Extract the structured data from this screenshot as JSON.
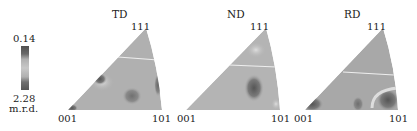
{
  "figure": {
    "colorbar": {
      "max_label": "0.14",
      "min_label": "2.28",
      "unit_label": "m.r.d.",
      "colors": [
        "#555555",
        "#777777",
        "#aaaaaa",
        "#c8c8c8",
        "#aaaaaa",
        "#777777",
        "#555555"
      ]
    },
    "panels": [
      {
        "title": "TD",
        "corner_001": "001",
        "corner_101": "101",
        "corner_111": "111"
      },
      {
        "title": "ND",
        "corner_001": "001",
        "corner_101": "101",
        "corner_111": "111"
      },
      {
        "title": "RD",
        "corner_001": "001",
        "corner_101": "101",
        "corner_111": "111"
      }
    ],
    "colors": {
      "background": "#ffffff",
      "triangle_fill": "#b4b4b4",
      "dark_region": "#6e6e6e",
      "light_region": "#d4d4d4",
      "divider_line": "#eeeeee",
      "text": "#222222"
    }
  }
}
